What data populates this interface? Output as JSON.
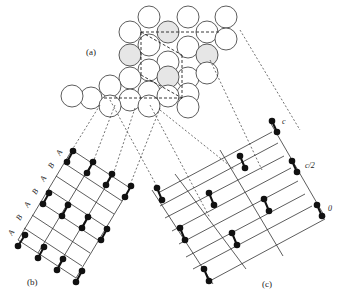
{
  "figure": {
    "panel_labels": {
      "a": "(a)",
      "b": "(b)",
      "c": "(c)"
    },
    "stacking_labels_b": [
      "A",
      "B",
      "A",
      "B",
      "A",
      "B",
      "A"
    ],
    "height_labels_c": {
      "top": "c",
      "middle": "c/2",
      "bottom": "0"
    },
    "colors": {
      "line": "#333333",
      "atom": "#111111",
      "shaded_circle": "#e6e6e6",
      "background": "#ffffff"
    }
  }
}
